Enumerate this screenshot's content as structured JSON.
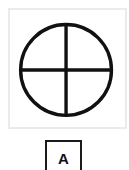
{
  "figure": {
    "shape": "circle-with-cross",
    "stroke_color": "#111111",
    "panel_border_color": "#ebebeb"
  },
  "option": {
    "label": "A",
    "border_color": "#1a1a1a"
  }
}
